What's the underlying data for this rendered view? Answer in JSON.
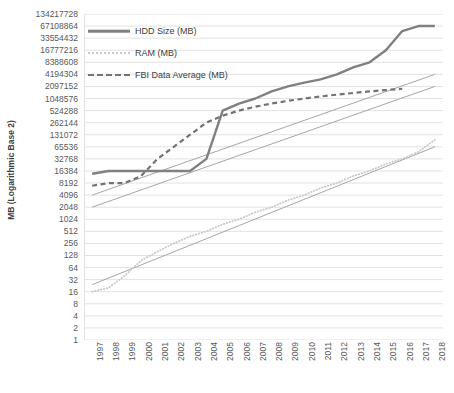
{
  "chart_data": {
    "type": "line",
    "title": "",
    "xlabel": "",
    "ylabel": "MB (Logarithmic Base 2)",
    "y_scale": "log2",
    "ylim": [
      1,
      134217728
    ],
    "grid": true,
    "legend_position": "top-left-inside",
    "y_ticks": [
      "134217728",
      "67108864",
      "33554432",
      "16777216",
      "8388608",
      "4194304",
      "2097152",
      "1048576",
      "524288",
      "262144",
      "131072",
      "65536",
      "32768",
      "16384",
      "8192",
      "4096",
      "2048",
      "1024",
      "512",
      "256",
      "128",
      "64",
      "32",
      "16",
      "8",
      "4",
      "2",
      "1"
    ],
    "x_ticks": [
      "1997",
      "1998",
      "1999",
      "2000",
      "2001",
      "2002",
      "2003",
      "2004",
      "2005",
      "2006",
      "2007",
      "2008",
      "2009",
      "2010",
      "2011",
      "2012",
      "2013",
      "2014",
      "2015",
      "2016",
      "2017",
      "2018"
    ],
    "series": [
      {
        "name": "HDD Size (MB)",
        "style": "solid",
        "color": "#808080",
        "x": [
          1997,
          1998,
          1999,
          2000,
          2001,
          2002,
          2003,
          2004,
          2005,
          2006,
          2007,
          2008,
          2009,
          2010,
          2011,
          2012,
          2013,
          2014,
          2015,
          2016,
          2017,
          2018
        ],
        "values": [
          14000,
          16384,
          16384,
          16384,
          16384,
          16384,
          16384,
          32768,
          524288,
          786432,
          1048576,
          1572864,
          2097152,
          2621440,
          3145728,
          4194304,
          6291456,
          8388608,
          16777216,
          50331648,
          67108864,
          67108864
        ]
      },
      {
        "name": "RAM (MB)",
        "style": "dotted",
        "color": "#c9c9c9",
        "x": [
          1997,
          1998,
          1999,
          2000,
          2001,
          2002,
          2003,
          2004,
          2005,
          2006,
          2007,
          2008,
          2009,
          2010,
          2011,
          2012,
          2013,
          2014,
          2015,
          2016,
          2017,
          2018
        ],
        "values": [
          16,
          20,
          40,
          96,
          160,
          256,
          384,
          512,
          768,
          1024,
          1536,
          2048,
          3072,
          4096,
          6144,
          8192,
          12288,
          16384,
          24576,
          32768,
          49152,
          98304
        ]
      },
      {
        "name": "FBI Data Average (MB)",
        "style": "dashed",
        "color": "#737373",
        "x": [
          1997,
          1998,
          1999,
          2000,
          2001,
          2002,
          2003,
          2004,
          2005,
          2006,
          2007,
          2008,
          2009,
          2010,
          2011,
          2012,
          2013,
          2014,
          2015,
          2016
        ],
        "values": [
          7000,
          8192,
          8192,
          12288,
          32768,
          65536,
          131072,
          262144,
          393216,
          524288,
          655360,
          786432,
          917504,
          1048576,
          1179648,
          1310720,
          1441792,
          1572864,
          1703936,
          1835008
        ]
      }
    ],
    "trendlines": [
      {
        "for": "HDD Size (MB)",
        "from": [
          1997,
          4096
        ],
        "to": [
          2018,
          4194304
        ],
        "color": "#a6a6a6"
      },
      {
        "for": "FBI Data Average (MB)",
        "from": [
          1997,
          2048
        ],
        "to": [
          2018,
          2097152
        ],
        "color": "#a6a6a6"
      },
      {
        "for": "RAM (MB)",
        "from": [
          1997,
          24
        ],
        "to": [
          2018,
          65536
        ],
        "color": "#a6a6a6"
      }
    ]
  },
  "legend": {
    "items": [
      {
        "label": "HDD Size (MB)",
        "style": "solid"
      },
      {
        "label": "RAM (MB)",
        "style": "dotted"
      },
      {
        "label": "FBI Data Average (MB)",
        "style": "dashed"
      }
    ]
  },
  "colors": {
    "hdd": "#808080",
    "ram": "#c9c9c9",
    "fbi": "#737373",
    "trend": "#a6a6a6",
    "grid": "#e2e2e2",
    "text": "#595959"
  }
}
